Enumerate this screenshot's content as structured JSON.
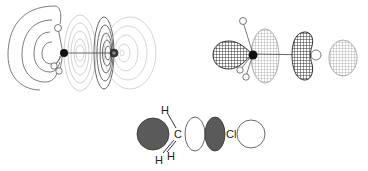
{
  "figure": {
    "molecule": "CH3Cl",
    "panels": [
      {
        "id": "contour-plot",
        "description": "orbital contour plot"
      },
      {
        "id": "wireframe-plot",
        "description": "3D wireframe orbital surface"
      },
      {
        "id": "schematic",
        "description": "schematic orbital lobes"
      }
    ],
    "schematic": {
      "labels": {
        "h_top": "H",
        "carbon": "C",
        "h_bottom_left": "H",
        "h_bottom_right": "H",
        "chlorine": "Cl"
      }
    },
    "colors": {
      "positive_lobe": "#555555",
      "negative_lobe": "#ffffff",
      "line": "#444444",
      "contour_dark": "#4a4a4a",
      "contour_light": "#b8b8b8"
    }
  }
}
